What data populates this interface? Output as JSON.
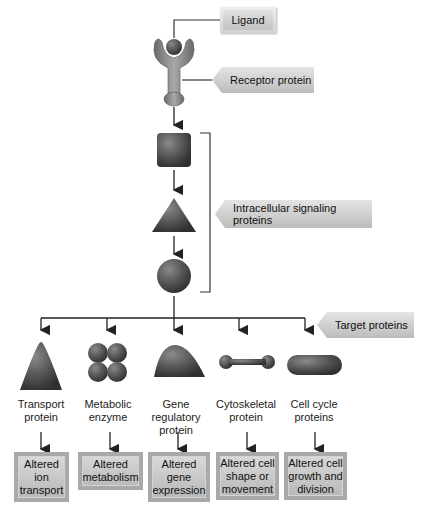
{
  "labels": {
    "ligand": "Ligand",
    "receptor": "Receptor protein",
    "intracellular": "Intracellular signaling proteins",
    "target": "Target proteins"
  },
  "targets": [
    {
      "name": "Transport protein",
      "line1": "Transport",
      "line2": "protein",
      "line3": "",
      "shape": "triangle-icon",
      "result": [
        "Altered",
        "ion",
        "transport"
      ]
    },
    {
      "name": "Metabolic enzyme",
      "line1": "Metabolic",
      "line2": "enzyme",
      "line3": "",
      "shape": "four-circles-icon",
      "result": [
        "Altered",
        "metabolism",
        ""
      ]
    },
    {
      "name": "Gene regulatory protein",
      "line1": "Gene",
      "line2": "regulatory",
      "line3": "protein",
      "shape": "dome-icon",
      "result": [
        "Altered",
        "gene",
        "expression"
      ]
    },
    {
      "name": "Cytoskeletal protein",
      "line1": "Cytoskeletal",
      "line2": "protein",
      "line3": "",
      "shape": "dumbbell-icon",
      "result": [
        "Altered cell",
        "shape or",
        "movement"
      ]
    },
    {
      "name": "Cell cycle proteins",
      "line1": "Cell cycle",
      "line2": "proteins",
      "line3": "",
      "shape": "capsule-icon",
      "result": [
        "Altered cell",
        "growth and",
        "division"
      ]
    }
  ],
  "colors": {
    "shape_dark": "#4a4a4a",
    "shape_mid": "#6e6e6e",
    "tag_light": "#e4e4e4",
    "tag_dark": "#bcbcbc",
    "line": "#222222"
  }
}
